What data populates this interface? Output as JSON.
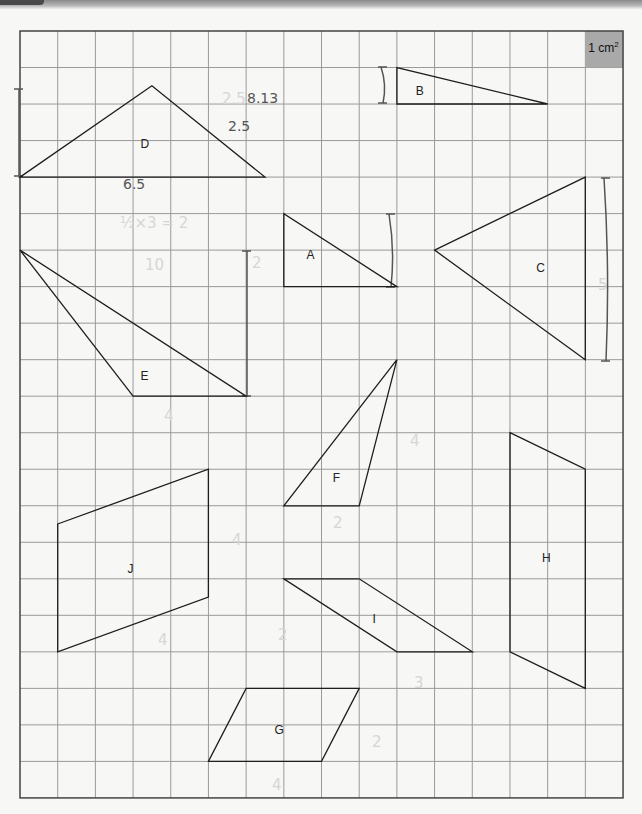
{
  "worksheet": {
    "grid": {
      "left": 20,
      "top": 31,
      "cols": 16,
      "rows": 21,
      "cell_w": 37.69,
      "cell_h": 36.52,
      "line_color": "#9a9a9a",
      "border_color": "#444444"
    },
    "unit_square": {
      "label": "1 cm",
      "superscript": "2",
      "fill": "#a9a9a9"
    },
    "shapes": [
      {
        "id": "D",
        "label": "D",
        "type": "triangle",
        "points": [
          [
            0,
            4
          ],
          [
            3.5,
            1.5
          ],
          [
            6.5,
            4
          ]
        ],
        "label_pos": [
          3.2,
          3.2
        ]
      },
      {
        "id": "B",
        "label": "B",
        "type": "triangle",
        "points": [
          [
            10,
            1
          ],
          [
            10,
            2
          ],
          [
            14,
            2
          ]
        ],
        "label_pos": [
          10.5,
          1.75
        ]
      },
      {
        "id": "A",
        "label": "A",
        "type": "triangle",
        "points": [
          [
            7,
            5
          ],
          [
            7,
            7
          ],
          [
            10,
            7
          ]
        ],
        "label_pos": [
          7.6,
          6.25
        ]
      },
      {
        "id": "C",
        "label": "C",
        "type": "triangle",
        "points": [
          [
            11,
            6
          ],
          [
            15,
            4
          ],
          [
            15,
            9
          ]
        ],
        "label_pos": [
          13.7,
          6.6
        ]
      },
      {
        "id": "E",
        "label": "E",
        "type": "triangle",
        "points": [
          [
            0,
            6
          ],
          [
            3,
            10
          ],
          [
            6,
            10
          ]
        ],
        "label_pos": [
          3.2,
          9.55
        ]
      },
      {
        "id": "F",
        "label": "F",
        "type": "triangle",
        "points": [
          [
            10,
            9
          ],
          [
            7,
            13
          ],
          [
            9,
            13
          ]
        ],
        "label_pos": [
          8.3,
          12.35
        ]
      },
      {
        "id": "J",
        "label": "J",
        "type": "parallelogram",
        "points": [
          [
            1,
            13.5
          ],
          [
            5,
            12
          ],
          [
            5,
            15.5
          ],
          [
            1,
            17
          ]
        ],
        "label_pos": [
          2.85,
          14.85
        ]
      },
      {
        "id": "I",
        "label": "I",
        "type": "parallelogram",
        "points": [
          [
            7,
            15
          ],
          [
            9,
            15
          ],
          [
            12,
            17
          ],
          [
            10,
            17
          ]
        ],
        "label_pos": [
          9.35,
          16.2
        ]
      },
      {
        "id": "H",
        "label": "H",
        "type": "trapezium",
        "points": [
          [
            13,
            11
          ],
          [
            15,
            12
          ],
          [
            15,
            18
          ],
          [
            13,
            17
          ]
        ],
        "label_pos": [
          13.85,
          14.55
        ]
      },
      {
        "id": "G",
        "label": "G",
        "type": "parallelogram",
        "points": [
          [
            6,
            18
          ],
          [
            9,
            18
          ],
          [
            8,
            20
          ],
          [
            5,
            20
          ]
        ],
        "label_pos": [
          6.75,
          19.25
        ]
      }
    ],
    "height_markers": [
      {
        "for": "D",
        "x": 19,
        "y1": 89,
        "y2": 176,
        "curved": false
      },
      {
        "for": "B",
        "x": 383,
        "y1": 67,
        "y2": 103,
        "curved": true
      },
      {
        "for": "A",
        "x": 391,
        "y1": 214,
        "y2": 287,
        "curved": true
      },
      {
        "for": "E",
        "x": 247,
        "y1": 251,
        "y2": 396,
        "curved": false
      },
      {
        "for": "C",
        "x": 606,
        "y1": 178,
        "y2": 361,
        "curved": true
      }
    ],
    "handwritten_notes": [
      {
        "text": "8.13",
        "x": 247,
        "y": 103,
        "style": "dark"
      },
      {
        "text": "2.5",
        "x": 228,
        "y": 131,
        "style": "dark"
      },
      {
        "text": "6.5",
        "x": 123,
        "y": 189,
        "style": "dark"
      },
      {
        "text": "2.5",
        "x": 222,
        "y": 104,
        "style": "faint"
      },
      {
        "text": "½×3 = 2",
        "x": 120,
        "y": 228,
        "style": "faint"
      },
      {
        "text": "10",
        "x": 145,
        "y": 270,
        "style": "faint"
      },
      {
        "text": "2",
        "x": 252,
        "y": 268,
        "style": "faint"
      },
      {
        "text": "5",
        "x": 598,
        "y": 290,
        "style": "faint"
      },
      {
        "text": "4",
        "x": 164,
        "y": 421,
        "style": "faint"
      },
      {
        "text": "4",
        "x": 410,
        "y": 446,
        "style": "faint"
      },
      {
        "text": "2",
        "x": 333,
        "y": 528,
        "style": "faint"
      },
      {
        "text": "4",
        "x": 232,
        "y": 545,
        "style": "faint"
      },
      {
        "text": "4",
        "x": 158,
        "y": 645,
        "style": "faint"
      },
      {
        "text": "2",
        "x": 278,
        "y": 640,
        "style": "faint"
      },
      {
        "text": "3",
        "x": 414,
        "y": 688,
        "style": "faint"
      },
      {
        "text": "2",
        "x": 372,
        "y": 747,
        "style": "faint"
      },
      {
        "text": "4",
        "x": 272,
        "y": 790,
        "style": "faint"
      }
    ]
  }
}
